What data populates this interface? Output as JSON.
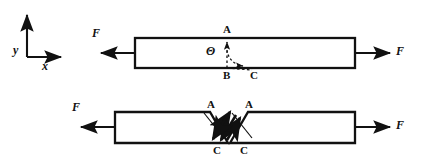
{
  "figure": {
    "stroke_color": "#111111",
    "fill_color": "#ffffff",
    "background": "#ffffff",
    "width": 432,
    "height": 166
  },
  "axes": {
    "y_label": "y",
    "x_label": "x",
    "origin": [
      27,
      57
    ],
    "y_tip": [
      27,
      12
    ],
    "x_tip": [
      64,
      57
    ]
  },
  "top_diagram": {
    "name": "intact-bar",
    "bar": {
      "x": 135,
      "y": 38,
      "width": 220,
      "height": 30
    },
    "force_left_label": "F",
    "force_right_label": "F",
    "angle_label": "Θ",
    "point_a_label": "A",
    "point_b_label": "B",
    "point_c_label": "C",
    "point_a": [
      227,
      38
    ],
    "point_b": [
      227,
      68
    ],
    "point_c": [
      252,
      68
    ]
  },
  "bottom_diagram": {
    "name": "sheared-bar",
    "force_left_label": "F",
    "force_right_label": "F",
    "left_piece_a_label": "A",
    "left_piece_c_label": "C",
    "right_piece_a_label": "A",
    "right_piece_c_label": "C",
    "left_piece": {
      "x": 115,
      "y": 112,
      "height": 31,
      "a_x": 210,
      "c_x": 228
    },
    "right_piece": {
      "a_x": 248,
      "c_x": 234,
      "x_end": 355,
      "y": 112,
      "height": 31
    },
    "shear_arrows": 4
  }
}
